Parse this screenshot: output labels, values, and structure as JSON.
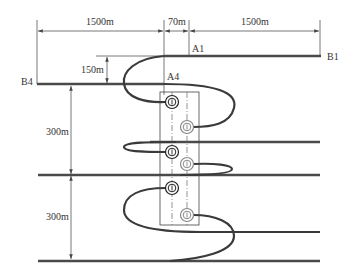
{
  "diagram": {
    "type": "well-layout-schematic",
    "dimensions": {
      "left_span": "1500m",
      "middle_span": "70m",
      "right_span": "1500m",
      "vertical_offset": "150m",
      "spacing_upper": "300m",
      "spacing_lower": "300m"
    },
    "labels": {
      "a1": "A1",
      "b1": "B1",
      "a4": "A4",
      "b4": "B4"
    },
    "wellheads": [
      {
        "id": "w1",
        "style": "dark"
      },
      {
        "id": "w2",
        "style": "light"
      },
      {
        "id": "w3",
        "style": "dark"
      },
      {
        "id": "w4",
        "style": "light"
      },
      {
        "id": "w5",
        "style": "dark"
      },
      {
        "id": "w6",
        "style": "light"
      }
    ],
    "colors": {
      "well_path": "#3a3a3a",
      "dark_wellhead": "#222222",
      "light_wellhead": "#888888",
      "dimension_line": "#555555"
    }
  }
}
